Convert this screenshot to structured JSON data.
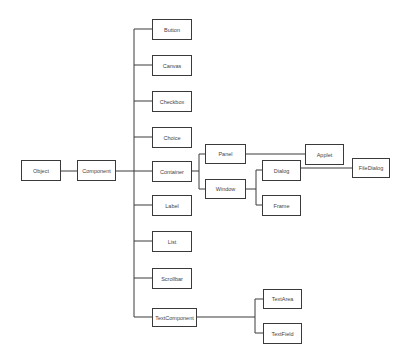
{
  "diagram": {
    "type": "class-hierarchy-tree",
    "line_color": "#3a3a3a",
    "nodes": {
      "object": "Object",
      "component": "Component",
      "button": "Button",
      "canvas": "Canvas",
      "checkbox": "Checkbox",
      "choice": "Choice",
      "container": "Container",
      "label": "Label",
      "list": "List",
      "scrollbar": "Scrollbar",
      "textcomponent": "TextComponent",
      "panel": "Panel",
      "window": "Window",
      "applet": "Applet",
      "dialog": "Dialog",
      "frame": "Frame",
      "filedialog": "FileDialog",
      "textarea": "TextArea",
      "textfield": "TextField"
    },
    "edges": [
      [
        "Object",
        "Component"
      ],
      [
        "Component",
        "Button"
      ],
      [
        "Component",
        "Canvas"
      ],
      [
        "Component",
        "Checkbox"
      ],
      [
        "Component",
        "Choice"
      ],
      [
        "Component",
        "Container"
      ],
      [
        "Component",
        "Label"
      ],
      [
        "Component",
        "List"
      ],
      [
        "Component",
        "Scrollbar"
      ],
      [
        "Component",
        "TextComponent"
      ],
      [
        "Container",
        "Panel"
      ],
      [
        "Container",
        "Window"
      ],
      [
        "Panel",
        "Applet"
      ],
      [
        "Window",
        "Dialog"
      ],
      [
        "Window",
        "Frame"
      ],
      [
        "Dialog",
        "FileDialog"
      ],
      [
        "TextComponent",
        "TextArea"
      ],
      [
        "TextComponent",
        "TextField"
      ]
    ]
  }
}
